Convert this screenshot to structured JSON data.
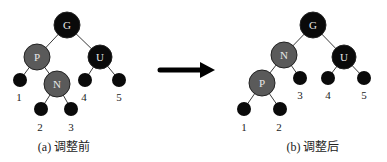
{
  "colors": {
    "black_node": "#0a0a0a",
    "red_node_gray": "#5a5a5a",
    "edge": "#3a3a3a"
  },
  "left": {
    "caption": "(a) 调整前",
    "nodes": {
      "G": "G",
      "P": "P",
      "U": "U",
      "N": "N"
    },
    "leaves": {
      "l1": "1",
      "l2": "2",
      "l3": "3",
      "l4": "4",
      "l5": "5"
    }
  },
  "arrow": {
    "icon": "right-arrow-icon"
  },
  "right": {
    "caption": "(b) 调整后",
    "nodes": {
      "G": "G",
      "N": "N",
      "U": "U",
      "P": "P"
    },
    "leaves": {
      "l1": "1",
      "l2": "2",
      "l3": "3",
      "l4": "4",
      "l5": "5"
    }
  }
}
